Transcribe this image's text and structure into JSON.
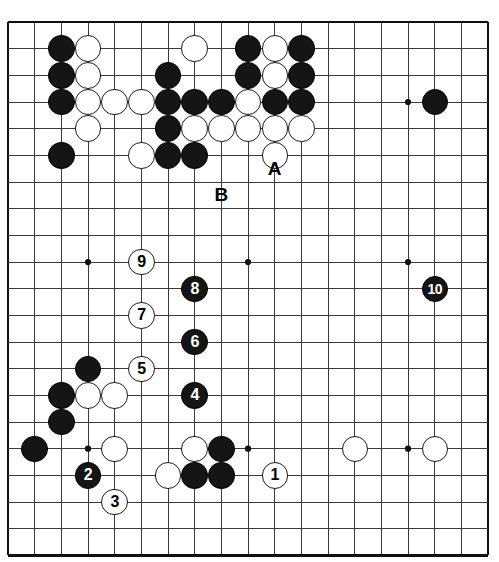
{
  "board": {
    "type": "go-board-diagram",
    "size": 19,
    "visible_columns": 18,
    "visible_rows": 20,
    "origin_x": 8,
    "origin_y": 22,
    "cell": 26.67,
    "line_color": "#3a3a3a",
    "border_color": "#111111",
    "background": "#ffffff",
    "stone_radius": 13.2,
    "star_points": [
      {
        "col": 3,
        "row": 3
      },
      {
        "col": 9,
        "row": 3
      },
      {
        "col": 15,
        "row": 3
      },
      {
        "col": 3,
        "row": 9
      },
      {
        "col": 9,
        "row": 9
      },
      {
        "col": 15,
        "row": 9
      },
      {
        "col": 3,
        "row": 16
      },
      {
        "col": 9,
        "row": 16
      },
      {
        "col": 15,
        "row": 16
      }
    ],
    "stones": [
      {
        "col": 2,
        "row": 1,
        "color": "black"
      },
      {
        "col": 3,
        "row": 1,
        "color": "white"
      },
      {
        "col": 7,
        "row": 1,
        "color": "white"
      },
      {
        "col": 9,
        "row": 1,
        "color": "black"
      },
      {
        "col": 10,
        "row": 1,
        "color": "white"
      },
      {
        "col": 11,
        "row": 1,
        "color": "black"
      },
      {
        "col": 2,
        "row": 2,
        "color": "black"
      },
      {
        "col": 3,
        "row": 2,
        "color": "white"
      },
      {
        "col": 6,
        "row": 2,
        "color": "black"
      },
      {
        "col": 9,
        "row": 2,
        "color": "black"
      },
      {
        "col": 10,
        "row": 2,
        "color": "white"
      },
      {
        "col": 11,
        "row": 2,
        "color": "black"
      },
      {
        "col": 2,
        "row": 3,
        "color": "black"
      },
      {
        "col": 3,
        "row": 3,
        "color": "white"
      },
      {
        "col": 4,
        "row": 3,
        "color": "white"
      },
      {
        "col": 5,
        "row": 3,
        "color": "white"
      },
      {
        "col": 6,
        "row": 3,
        "color": "black"
      },
      {
        "col": 7,
        "row": 3,
        "color": "black"
      },
      {
        "col": 8,
        "row": 3,
        "color": "black"
      },
      {
        "col": 9,
        "row": 3,
        "color": "white"
      },
      {
        "col": 10,
        "row": 3,
        "color": "black"
      },
      {
        "col": 11,
        "row": 3,
        "color": "black"
      },
      {
        "col": 16,
        "row": 3,
        "color": "black"
      },
      {
        "col": 3,
        "row": 4,
        "color": "white"
      },
      {
        "col": 6,
        "row": 4,
        "color": "black"
      },
      {
        "col": 7,
        "row": 4,
        "color": "white"
      },
      {
        "col": 8,
        "row": 4,
        "color": "white"
      },
      {
        "col": 9,
        "row": 4,
        "color": "white"
      },
      {
        "col": 10,
        "row": 4,
        "color": "white"
      },
      {
        "col": 11,
        "row": 4,
        "color": "white"
      },
      {
        "col": 2,
        "row": 5,
        "color": "black"
      },
      {
        "col": 5,
        "row": 5,
        "color": "white"
      },
      {
        "col": 6,
        "row": 5,
        "color": "black"
      },
      {
        "col": 7,
        "row": 5,
        "color": "black"
      },
      {
        "col": 10,
        "row": 5,
        "color": "white"
      },
      {
        "col": 3,
        "row": 13,
        "color": "black"
      },
      {
        "col": 2,
        "row": 14,
        "color": "black"
      },
      {
        "col": 3,
        "row": 14,
        "color": "white"
      },
      {
        "col": 4,
        "row": 14,
        "color": "white"
      },
      {
        "col": 2,
        "row": 15,
        "color": "black"
      },
      {
        "col": 1,
        "row": 16,
        "color": "black"
      },
      {
        "col": 4,
        "row": 16,
        "color": "white"
      },
      {
        "col": 7,
        "row": 16,
        "color": "white"
      },
      {
        "col": 8,
        "row": 16,
        "color": "black"
      },
      {
        "col": 13,
        "row": 16,
        "color": "white"
      },
      {
        "col": 16,
        "row": 16,
        "color": "white"
      },
      {
        "col": 6,
        "row": 17,
        "color": "white"
      },
      {
        "col": 7,
        "row": 17,
        "color": "black"
      },
      {
        "col": 8,
        "row": 17,
        "color": "black"
      }
    ],
    "numbered_moves": [
      {
        "label": "1",
        "col": 10,
        "row": 17,
        "color": "white"
      },
      {
        "label": "2",
        "col": 3,
        "row": 17,
        "color": "black"
      },
      {
        "label": "3",
        "col": 4,
        "row": 18,
        "color": "white"
      },
      {
        "label": "4",
        "col": 7,
        "row": 14,
        "color": "black"
      },
      {
        "label": "5",
        "col": 5,
        "row": 13,
        "color": "white"
      },
      {
        "label": "6",
        "col": 7,
        "row": 12,
        "color": "black"
      },
      {
        "label": "7",
        "col": 5,
        "row": 11,
        "color": "white"
      },
      {
        "label": "8",
        "col": 7,
        "row": 10,
        "color": "black"
      },
      {
        "label": "9",
        "col": 5,
        "row": 9,
        "color": "white"
      },
      {
        "label": "10",
        "col": 16,
        "row": 10,
        "color": "black"
      }
    ],
    "point_labels": [
      {
        "label": "A",
        "col": 10,
        "row": 5.5
      },
      {
        "label": "B",
        "col": 8,
        "row": 6.5
      }
    ]
  }
}
